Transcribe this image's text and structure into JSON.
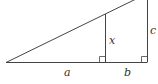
{
  "diagram": {
    "type": "similar-right-triangles",
    "colors": {
      "stroke": "#444444",
      "background": "#ffffff"
    },
    "labels": {
      "a": "a",
      "b": "b",
      "x": "x",
      "c": "c"
    }
  }
}
